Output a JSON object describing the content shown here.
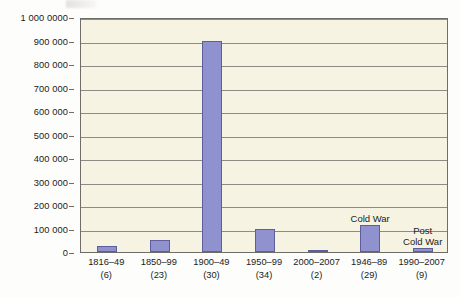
{
  "chart_data": {
    "type": "bar",
    "title": "",
    "subtitle": "",
    "xlabel": "",
    "ylabel": "",
    "ylim": [
      0,
      1000000
    ],
    "grid": true,
    "legend": "none",
    "categories": [
      "1816–49",
      "1850–99",
      "1900–49",
      "1950–99",
      "2000–2007",
      "1946–89",
      "1990–2007"
    ],
    "category_counts": [
      "(6)",
      "(23)",
      "(30)",
      "(34)",
      "(2)",
      "(29)",
      "(9)"
    ],
    "values": [
      25000,
      50000,
      900000,
      100000,
      5000,
      115000,
      15000
    ],
    "ytick_labels": [
      "0",
      "100 000",
      "200 000",
      "300 000",
      "400 000",
      "500 000",
      "600 000",
      "700 000",
      "800 000",
      "900 000",
      "1 000 0000"
    ],
    "ytick_values": [
      0,
      100000,
      200000,
      300000,
      400000,
      500000,
      600000,
      700000,
      800000,
      900000,
      1000000
    ],
    "annotations": [
      {
        "text": "Cold War",
        "category_index": 5
      },
      {
        "text": "Post\nCold War",
        "category_index": 6
      }
    ],
    "colors": {
      "bar_fill": "#8f92cf",
      "bar_border": "#5d5f9c",
      "plot_background": "#f6f3e2",
      "gridline": "#8d8b83",
      "axis": "#6f6d68",
      "text": "#1b1b1b",
      "page_background": "#fdfdfb"
    }
  }
}
